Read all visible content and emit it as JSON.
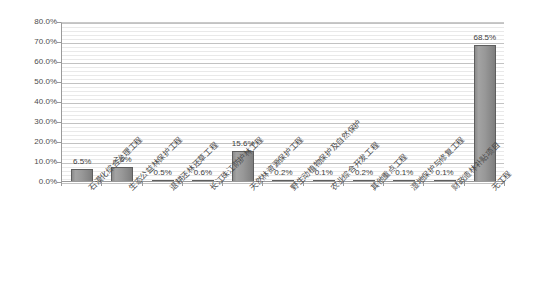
{
  "chart_data": {
    "type": "bar",
    "title": "",
    "subtitle": "",
    "xlabel": "",
    "ylabel": "",
    "ylim": [
      0,
      80
    ],
    "grid": true,
    "legend": "none",
    "y_ticks": [
      "0.0%",
      "10.0%",
      "20.0%",
      "30.0%",
      "40.0%",
      "50.0%",
      "60.0%",
      "70.0%",
      "80.0%"
    ],
    "y_tick_values": [
      0,
      10,
      20,
      30,
      40,
      50,
      60,
      70,
      80
    ],
    "categories": [
      "石漠化综合治理工程",
      "生态公益林保护工程",
      "退耕还林还草工程",
      "长江珠江防护林工程",
      "天然林资源保护工程",
      "野生动植物保护及自然保护",
      "农业综合开发工程",
      "其他重点工程",
      "湿地保护与修复工程",
      "财政造林补贴项目",
      "无工程"
    ],
    "values": [
      6.5,
      7.6,
      0.5,
      0.6,
      15.6,
      0.2,
      0.1,
      0.2,
      0.1,
      0.1,
      68.5
    ],
    "value_labels": [
      "6.5%",
      "7.6%",
      "0.5%",
      "0.6%",
      "15.6%",
      "0.2%",
      "0.1%",
      "0.2%",
      "0.1%",
      "0.1%",
      "68.5%"
    ],
    "bar_color": "#989898",
    "bar_border_color": "#5e5e5e",
    "gridline_color": "#c2c2c2",
    "minor_gridline_color": "#e9e9e9",
    "axis_color": "#9a9a9a",
    "text_color": "#4a4a4a",
    "background": "#ffffff"
  }
}
